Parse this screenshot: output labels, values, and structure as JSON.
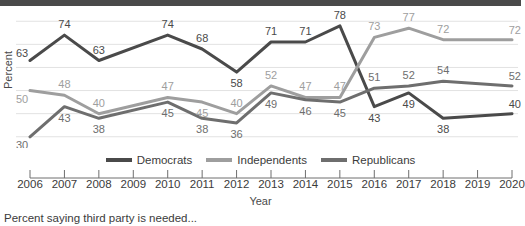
{
  "figure": {
    "caption": "Percent saying third party is needed...",
    "top_band_color": "#4a4a4a"
  },
  "chart_data": {
    "type": "line",
    "title": "",
    "xlabel": "Year",
    "ylabel": "Percent",
    "x": [
      2006,
      2007,
      2008,
      2009,
      2010,
      2011,
      2012,
      2013,
      2014,
      2015,
      2016,
      2017,
      2018,
      2019,
      2020
    ],
    "categories": [
      "2006",
      "2007",
      "2008",
      "2009",
      "2010",
      "2011",
      "2012",
      "2013",
      "2014",
      "2015",
      "2016",
      "2017",
      "2018",
      "2019",
      "2020"
    ],
    "ylim": [
      26,
      84
    ],
    "xlim": [
      2006,
      2020
    ],
    "grid": true,
    "grid_values": [
      80,
      70,
      60,
      50,
      40,
      30
    ],
    "legend_position": "bottom-center",
    "series": [
      {
        "name": "Democrats",
        "color": "#4a4a4a",
        "values": [
          63,
          74,
          63,
          null,
          74,
          68,
          58,
          71,
          71,
          78,
          43,
          49,
          38,
          null,
          40
        ],
        "labels": [
          "63",
          "74",
          "63",
          "",
          "74",
          "68",
          "58",
          "71",
          "71",
          "78",
          "43",
          "49",
          "38",
          "",
          "40"
        ],
        "label_side": [
          "above",
          "above",
          "above",
          "",
          "above",
          "above",
          "below",
          "above",
          "above",
          "above",
          "below",
          "below",
          "below",
          "",
          "above"
        ]
      },
      {
        "name": "Independents",
        "color": "#9e9e9e",
        "values": [
          50,
          48,
          40,
          null,
          47,
          45,
          40,
          52,
          47,
          47,
          73,
          77,
          72,
          null,
          72
        ],
        "labels": [
          "50",
          "48",
          "40",
          "",
          "47",
          "45",
          "40",
          "52",
          "47",
          "47",
          "73",
          "77",
          "72",
          "",
          "72"
        ],
        "label_side": [
          "below",
          "above",
          "above",
          "",
          "above",
          "below",
          "above",
          "above",
          "above",
          "above",
          "above",
          "above",
          "above",
          "",
          "above"
        ]
      },
      {
        "name": "Republicans",
        "color": "#6e6e6e",
        "values": [
          30,
          43,
          38,
          null,
          45,
          38,
          36,
          49,
          46,
          45,
          51,
          52,
          54,
          null,
          52
        ],
        "labels": [
          "30",
          "43",
          "38",
          "",
          "45",
          "38",
          "36",
          "49",
          "46",
          "45",
          "51",
          "52",
          "54",
          "",
          "52"
        ],
        "label_side": [
          "below",
          "below",
          "below",
          "",
          "below",
          "below",
          "below",
          "below",
          "below",
          "below",
          "above",
          "above",
          "above",
          "",
          "above"
        ]
      }
    ]
  },
  "legend": {
    "items": [
      {
        "label": "Democrats",
        "color": "#4a4a4a"
      },
      {
        "label": "Independents",
        "color": "#9e9e9e"
      },
      {
        "label": "Republicans",
        "color": "#6e6e6e"
      }
    ]
  }
}
